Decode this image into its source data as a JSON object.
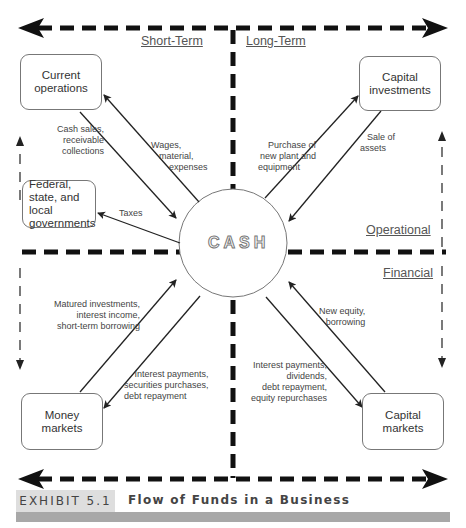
{
  "diagram": {
    "title": "Flow of Funds in a Business",
    "exhibit_label": "EXHIBIT 5.1",
    "center": "CASH",
    "quadrant_labels": {
      "top_left": "Short-Term",
      "top_right": "Long-Term",
      "right_upper": "Operational",
      "right_lower": "Financial"
    },
    "nodes": {
      "current_operations": "Current operations",
      "governments": "Federal, state, and local governments",
      "capital_investments": "Capital investments",
      "money_markets": "Money markets",
      "capital_markets": "Capital markets"
    },
    "flows": {
      "cash_sales": [
        "Cash sales,",
        "receivable",
        "collections"
      ],
      "wages": [
        "Wages,",
        "material,",
        "expenses"
      ],
      "taxes": [
        "Taxes"
      ],
      "purchase_plant": [
        "Purchase of",
        "new plant and",
        "equipment"
      ],
      "sale_assets": [
        "Sale of",
        "assets"
      ],
      "matured_investments": [
        "Matured investments,",
        "interest income,",
        "short-term borrowing"
      ],
      "interest_payments_money": [
        "Interest payments,",
        "securities purchases,",
        "debt repayment"
      ],
      "new_equity": [
        "New equity,",
        "borrowing"
      ],
      "interest_payments_capital": [
        "Interest payments,",
        "dividends,",
        "debt repayment,",
        "equity repurchases"
      ]
    },
    "edges": [
      {
        "from": "CASH",
        "to": "Current operations",
        "label": "Wages, material, expenses"
      },
      {
        "from": "Current operations",
        "to": "CASH",
        "label": "Cash sales, receivable collections"
      },
      {
        "from": "CASH",
        "to": "Federal, state, and local governments",
        "label": "Taxes"
      },
      {
        "from": "CASH",
        "to": "Capital investments",
        "label": "Purchase of new plant and equipment"
      },
      {
        "from": "Capital investments",
        "to": "CASH",
        "label": "Sale of assets"
      },
      {
        "from": "Money markets",
        "to": "CASH",
        "label": "Matured investments, interest income, short-term borrowing"
      },
      {
        "from": "CASH",
        "to": "Money markets",
        "label": "Interest payments, securities purchases, debt repayment"
      },
      {
        "from": "Capital markets",
        "to": "CASH",
        "label": "New equity, borrowing"
      },
      {
        "from": "CASH",
        "to": "Capital markets",
        "label": "Interest payments, dividends, debt repayment, equity repurchases"
      }
    ]
  }
}
